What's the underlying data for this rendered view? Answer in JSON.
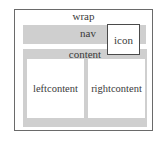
{
  "diagram": {
    "wrap": {
      "label": "wrap"
    },
    "nav": {
      "label": "nav"
    },
    "icon": {
      "label": "icon"
    },
    "content": {
      "label": "content",
      "left": {
        "label": "leftcontent"
      },
      "right": {
        "label": "rightcontent"
      }
    }
  },
  "colors": {
    "border": "#6a6a6a",
    "box_fill": "#cfcfcf",
    "panel_fill": "#ffffff",
    "text": "#3a3a3a"
  }
}
